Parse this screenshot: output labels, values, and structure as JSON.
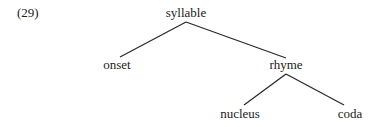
{
  "example_number": "(29)",
  "tree": {
    "root": "syllable",
    "children": [
      {
        "label": "onset"
      },
      {
        "label": "rhyme",
        "children": [
          {
            "label": "nucleus"
          },
          {
            "label": "coda"
          }
        ]
      }
    ]
  },
  "nodes": {
    "syllable": "syllable",
    "onset": "onset",
    "rhyme": "rhyme",
    "nucleus": "nucleus",
    "coda": "coda"
  }
}
